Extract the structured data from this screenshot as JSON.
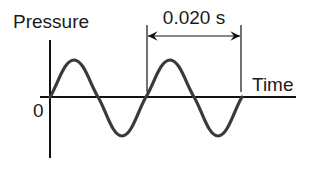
{
  "diagram": {
    "type": "sound-pressure-waveform",
    "y_axis_label": "Pressure",
    "x_axis_label": "Time",
    "origin_label": "0",
    "period_annotation": "0.020 s",
    "cycles_shown": 2,
    "colors": {
      "axis": "#111111",
      "wave": "#3a3a3a",
      "text": "#1a1a1a",
      "background": "#ffffff"
    }
  }
}
